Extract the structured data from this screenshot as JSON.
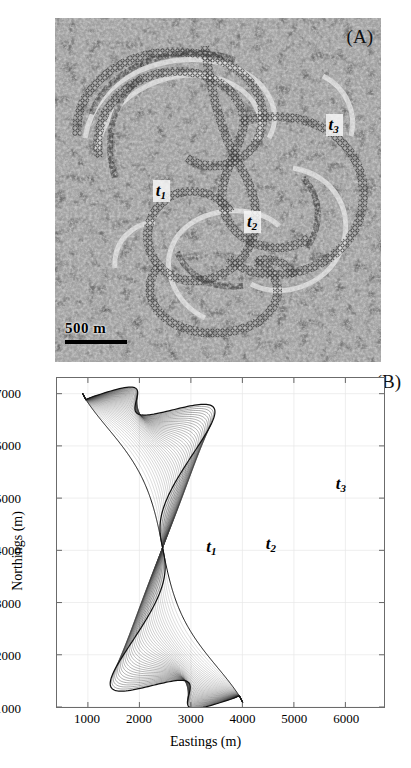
{
  "figure": {
    "panel_a": {
      "label": "(A)",
      "scalebar_text": "500 m",
      "scalebar_length_m": 500,
      "description": "aerial-photograph-with-digitized-channel-centerlines",
      "time_labels": [
        {
          "id": "t1",
          "base": "t",
          "sub": "1",
          "x_pct": 32,
          "y_pct": 50,
          "boxed": true
        },
        {
          "id": "t2",
          "base": "t",
          "sub": "2",
          "x_pct": 60,
          "y_pct": 58,
          "boxed": true
        },
        {
          "id": "t3",
          "base": "t",
          "sub": "3",
          "x_pct": 84,
          "y_pct": 31,
          "boxed": true
        }
      ]
    },
    "panel_b": {
      "label": "(B)",
      "time_labels": [
        {
          "id": "t1",
          "base": "t",
          "sub": "1",
          "x": 3300,
          "y": 4050
        },
        {
          "id": "t2",
          "base": "t",
          "sub": "2",
          "x": 4450,
          "y": 4100
        },
        {
          "id": "t3",
          "base": "t",
          "sub": "3",
          "x": 5800,
          "y": 5250
        }
      ]
    }
  },
  "chart_data": {
    "type": "line",
    "title": "",
    "xlabel": "Eastings (m)",
    "ylabel": "Northings (m)",
    "xlim": [
      400,
      6750
    ],
    "ylim": [
      1000,
      7300
    ],
    "xticks": [
      1000,
      2000,
      3000,
      4000,
      5000,
      6000
    ],
    "yticks": [
      1000,
      2000,
      3000,
      4000,
      5000,
      6000,
      7000
    ],
    "xtick_labels": [
      "1000",
      "2000",
      "3000",
      "4000",
      "5000",
      "6000"
    ],
    "ytick_labels": [
      "1000",
      "2000",
      "3000",
      "4000",
      "5000",
      "6000",
      "7000"
    ],
    "grid": true,
    "legend": "none",
    "series_count": 40,
    "series_description": "simulated-meander-centerline-at-successive-timesteps",
    "annotations": [
      {
        "text": "t1",
        "x": 3300,
        "y": 4050
      },
      {
        "text": "t2",
        "x": 4450,
        "y": 4100
      },
      {
        "text": "t3",
        "x": 5800,
        "y": 5250
      },
      {
        "text": "(B)",
        "x": 6300,
        "y": 7150
      }
    ],
    "series": [
      {
        "name": "t1",
        "role": "initial-centerline"
      },
      {
        "name": "t2",
        "role": "intermediate-centerline"
      },
      {
        "name": "t3",
        "role": "final-centerline"
      }
    ]
  }
}
